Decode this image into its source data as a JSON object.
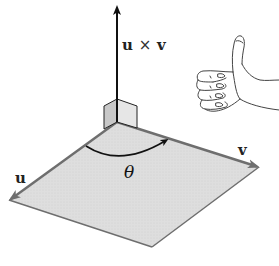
{
  "diagram": {
    "labels": {
      "cross_product": {
        "u": "u",
        "times": "×",
        "v": "v"
      },
      "vector_u": "u",
      "vector_v": "v",
      "angle": "θ"
    },
    "colors": {
      "plane_fill": "#dcdcdc",
      "plane_edge": "#6e6e6e",
      "arrow": "#111111",
      "cube_face_left": "#c8c8c8",
      "cube_face_right": "#e6e6e6",
      "hand_stroke": "#444444"
    },
    "icons": {
      "hand": "thumbs-up-right-hand-icon"
    }
  }
}
